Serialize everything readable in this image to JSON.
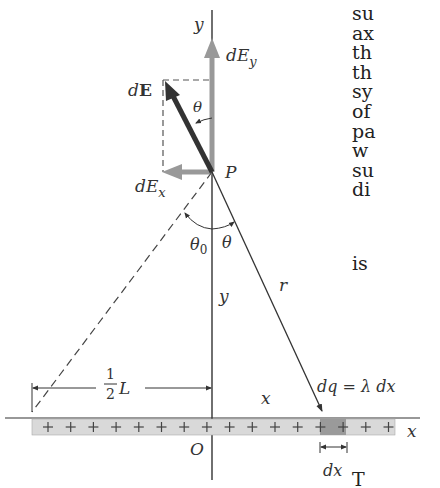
{
  "figure": {
    "labels": {
      "y_axis_top": "y",
      "dE": "dE",
      "dE_bold_part": "E",
      "dE_d_part": "d",
      "theta_top": "θ",
      "dEy_d": "dE",
      "dEy_sub": "y",
      "dEx_d": "dE",
      "dEx_sub": "x",
      "point_P": "P",
      "theta0": "θ",
      "theta0_sub": "0",
      "theta": "θ",
      "y_segment": "y",
      "r_segment": "r",
      "half_num": "1",
      "half_den": "2",
      "half_L": "L",
      "x_segment": "x",
      "dq": "dq = λ dx",
      "x_axis": "x",
      "origin": "O",
      "dx": "dx"
    },
    "charge_symbol": "+",
    "charge_count": 16,
    "colors": {
      "dE_vector": "#333333",
      "component_vectors": "#999999",
      "rod_fill": "#d9d9d9",
      "rod_element_fill": "#9a9a9a",
      "line": "#333333"
    }
  },
  "side_text": {
    "lines": [
      "su",
      "ax",
      "th",
      "th",
      "sy",
      "of",
      "pa",
      "w",
      "su",
      "di"
    ],
    "line_is": "is",
    "line_bottom": "T"
  }
}
